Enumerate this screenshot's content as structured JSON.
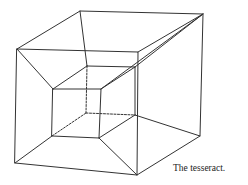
{
  "figure": {
    "caption": "The tesseract.",
    "line_color": "#333333",
    "outer_front": [
      [
        17,
        49
      ],
      [
        138,
        52
      ],
      [
        137,
        175
      ],
      [
        15,
        163
      ]
    ],
    "outer_back": [
      [
        80,
        11
      ],
      [
        203,
        14
      ],
      [
        200,
        136
      ]
    ],
    "inner_front": [
      [
        53,
        89
      ],
      [
        101,
        89
      ],
      [
        99,
        138
      ],
      [
        52,
        136
      ]
    ],
    "inner_back": [
      [
        87,
        66
      ],
      [
        135,
        67
      ],
      [
        135,
        115
      ],
      [
        86,
        113
      ]
    ]
  }
}
